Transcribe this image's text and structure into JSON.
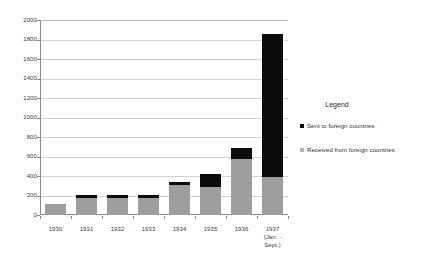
{
  "chart_data": {
    "type": "bar",
    "subtype": "stacked-vertical",
    "title": "",
    "xlabel": "",
    "ylabel": "",
    "ylim": [
      0,
      2000
    ],
    "ytick_step": 200,
    "ytick_labels": [
      "2000",
      "1800",
      "1600",
      "1400",
      "1200",
      "1000",
      "800",
      "600",
      "400",
      "200",
      "0"
    ],
    "ytick_values": [
      2000,
      1800,
      1600,
      1400,
      1200,
      1000,
      800,
      600,
      400,
      200,
      0
    ],
    "grid": true,
    "grid_axis": "y",
    "legend_position": "right",
    "categories": [
      "1930",
      "1931",
      "1932",
      "1933",
      "1934",
      "1935",
      "1936",
      "1937"
    ],
    "category_sublabels": [
      "",
      "",
      "",
      "",
      "",
      "",
      "",
      "(Jan. - Sept.)"
    ],
    "series": [
      {
        "name": "Received from foreign countries",
        "color": "#9e9e9e",
        "values": [
          110,
          170,
          175,
          170,
          310,
          290,
          570,
          395
        ]
      },
      {
        "name": "Sent to foreign countries",
        "color": "#0b0b0b",
        "values": [
          0,
          35,
          35,
          35,
          30,
          130,
          120,
          1460
        ]
      }
    ],
    "totals": [
      110,
      205,
      210,
      205,
      340,
      420,
      690,
      1855
    ]
  },
  "legend": {
    "title": "Legend",
    "items": [
      {
        "label": "Sent to foreign countries",
        "color": "#0b0b0b"
      },
      {
        "label": "Received from foreign countries",
        "color": "#b4b4b4"
      }
    ]
  },
  "colors": {
    "received": "#9e9e9e",
    "sent": "#0b0b0b",
    "axis": "#8a8a8a",
    "grid": "#d2d2d2",
    "background": "#ffffff",
    "text": "#2b2b2b"
  }
}
